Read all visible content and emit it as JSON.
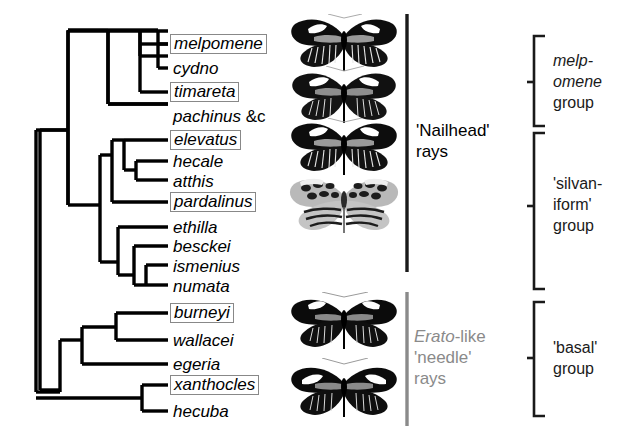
{
  "figure": {
    "type": "phylogenetic-tree",
    "title_present": false,
    "species_count": 15
  },
  "tree": {
    "tips": [
      {
        "id": "melpomene",
        "label": "melpomene",
        "suffix": "",
        "boxed": true,
        "y": 44
      },
      {
        "id": "cydno",
        "label": "cydno",
        "suffix": "",
        "boxed": false,
        "y": 68
      },
      {
        "id": "timareta",
        "label": "timareta",
        "suffix": "",
        "boxed": true,
        "y": 92
      },
      {
        "id": "pachinus",
        "label": "pachinus",
        "suffix": " &c",
        "boxed": false,
        "y": 116
      },
      {
        "id": "elevatus",
        "label": "elevatus",
        "suffix": "",
        "boxed": true,
        "y": 140
      },
      {
        "id": "hecale",
        "label": "hecale",
        "suffix": "",
        "boxed": false,
        "y": 161
      },
      {
        "id": "atthis",
        "label": "atthis",
        "suffix": "",
        "boxed": false,
        "y": 180
      },
      {
        "id": "pardalinus",
        "label": "pardalinus",
        "suffix": "",
        "boxed": true,
        "y": 202
      },
      {
        "id": "ethilla",
        "label": "ethilla",
        "suffix": "",
        "boxed": false,
        "y": 227
      },
      {
        "id": "besckei",
        "label": "besckei",
        "suffix": "",
        "boxed": false,
        "y": 246
      },
      {
        "id": "ismenius",
        "label": "ismenius",
        "suffix": "",
        "boxed": false,
        "y": 265
      },
      {
        "id": "numata",
        "label": "numata",
        "suffix": "",
        "boxed": false,
        "y": 285
      },
      {
        "id": "burneyi",
        "label": "burneyi",
        "suffix": "",
        "boxed": true,
        "y": 313
      },
      {
        "id": "wallacei",
        "label": "wallacei",
        "suffix": "",
        "boxed": false,
        "y": 340
      },
      {
        "id": "egeria",
        "label": "egeria",
        "suffix": "",
        "boxed": false,
        "y": 364
      },
      {
        "id": "xanthocles",
        "label": "xanthocles",
        "suffix": "",
        "boxed": true,
        "y": 385
      },
      {
        "id": "hecuba",
        "label": "hecuba",
        "suffix": "",
        "boxed": false,
        "y": 411
      }
    ]
  },
  "ray_annotations": [
    {
      "id": "nailhead",
      "lines": [
        "'Nailhead'",
        "rays"
      ],
      "color": "#000000",
      "italic_first_word": false
    },
    {
      "id": "needle",
      "lines": [
        "Erato-like",
        "'needle'",
        "rays"
      ],
      "color": "#8a8a8a",
      "italic_first_word": true
    }
  ],
  "groups": [
    {
      "id": "melpomene-group",
      "lines": [
        "melp-",
        "omene",
        "group"
      ],
      "italic_lines": [
        true,
        true,
        false
      ]
    },
    {
      "id": "silvaniform-group",
      "lines": [
        "'silvan-",
        "iform'",
        "group"
      ],
      "italic_lines": [
        false,
        false,
        false
      ]
    },
    {
      "id": "basal-group",
      "lines": [
        "'basal'",
        "group"
      ],
      "italic_lines": [
        false,
        false
      ]
    }
  ],
  "butterfly_images": [
    {
      "id": "butterfly-melpomene",
      "row": "melpomene"
    },
    {
      "id": "butterfly-cydno",
      "row": "cydno"
    },
    {
      "id": "butterfly-timareta",
      "row": "timareta"
    },
    {
      "id": "butterfly-pardalinus",
      "row": "pardalinus"
    },
    {
      "id": "butterfly-burneyi",
      "row": "burneyi"
    },
    {
      "id": "butterfly-xanthocles",
      "row": "xanthocles"
    }
  ],
  "colors": {
    "line": "#000000",
    "box_border": "#888888",
    "gray_text": "#8a8a8a",
    "bracket": "#1a1a1a",
    "background": "#ffffff"
  }
}
